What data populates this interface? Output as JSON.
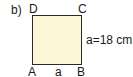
{
  "part_label": "b)",
  "vertices": {
    "top_left": "D",
    "top_right": "C",
    "bottom_left": "A",
    "bottom_right": "B"
  },
  "bottom_side_label": "a",
  "side_length_label": "a=18 cm",
  "colors": {
    "fill": "#fcf7d6",
    "stroke": "#2a2a2a"
  }
}
